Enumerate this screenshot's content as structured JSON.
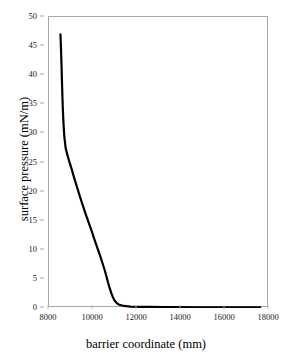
{
  "chart_data": {
    "type": "line",
    "title": "",
    "xlabel": "barrier coordinate (mm)",
    "ylabel": "surface pressure (mN/m)",
    "xlim": [
      8000,
      18000
    ],
    "ylim": [
      0,
      50
    ],
    "xticks": [
      8000,
      10000,
      12000,
      14000,
      16000,
      18000
    ],
    "yticks": [
      0,
      5,
      10,
      15,
      20,
      25,
      30,
      35,
      40,
      45,
      50
    ],
    "xtick_labels": [
      "8000",
      "10000",
      "12000",
      "14000",
      "16000",
      "18000"
    ],
    "ytick_labels": [
      "0",
      "5",
      "10",
      "15",
      "20",
      "25",
      "30",
      "35",
      "40",
      "45",
      "50"
    ],
    "grid": false,
    "legend": false,
    "line_color": "#000000",
    "line_width": 2.2,
    "frame_color": "#a8a8a8",
    "background": "#ffffff",
    "series": [
      {
        "name": "surface pressure isotherm",
        "x": [
          8520,
          8540,
          8555,
          8570,
          8580,
          8595,
          8610,
          8630,
          8660,
          8700,
          8760,
          8830,
          8920,
          9020,
          9140,
          9270,
          9400,
          9540,
          9680,
          9820,
          9960,
          10090,
          10210,
          10330,
          10440,
          10540,
          10620,
          10690,
          10760,
          10830,
          10900,
          10980,
          11080,
          11200,
          11400,
          11700,
          12100,
          12600,
          13200,
          13900,
          14700,
          15600,
          16500,
          17100,
          17600
        ],
        "y": [
          47.0,
          45.2,
          43.4,
          41.6,
          40.2,
          38.2,
          36.3,
          34.1,
          31.6,
          29.3,
          27.4,
          26.4,
          25.2,
          24.0,
          22.4,
          20.8,
          19.2,
          17.6,
          16.0,
          14.5,
          13.0,
          11.5,
          10.2,
          8.9,
          7.6,
          6.4,
          5.3,
          4.3,
          3.4,
          2.6,
          1.9,
          1.3,
          0.85,
          0.55,
          0.35,
          0.25,
          0.2,
          0.18,
          0.15,
          0.14,
          0.12,
          0.11,
          0.1,
          0.1,
          0.1
        ]
      }
    ]
  }
}
